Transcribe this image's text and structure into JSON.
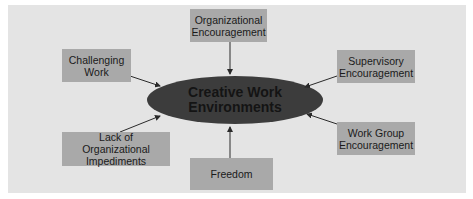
{
  "diagram": {
    "center": {
      "label": "Creative Work\nEnvironments",
      "color": "#3c3c3c"
    },
    "nodes": [
      {
        "id": "organizational-encouragement",
        "label": "Organizational\nEncouragement",
        "position": "top"
      },
      {
        "id": "challenging-work",
        "label": "Challenging\nWork",
        "position": "top-left"
      },
      {
        "id": "supervisory-encouragement",
        "label": "Supervisory\nEncouragement",
        "position": "top-right"
      },
      {
        "id": "lack-of-organizational-impediments",
        "label": "Lack of Organizational\nImpediments",
        "position": "bottom-left"
      },
      {
        "id": "freedom",
        "label": "Freedom",
        "position": "bottom"
      },
      {
        "id": "work-group-encouragement",
        "label": "Work Group\nEncouragement",
        "position": "bottom-right"
      }
    ],
    "edges": [
      {
        "from": "organizational-encouragement",
        "to": "center"
      },
      {
        "from": "challenging-work",
        "to": "center"
      },
      {
        "from": "supervisory-encouragement",
        "to": "center"
      },
      {
        "from": "lack-of-organizational-impediments",
        "to": "center"
      },
      {
        "from": "freedom",
        "to": "center"
      },
      {
        "from": "work-group-encouragement",
        "to": "center"
      }
    ],
    "colors": {
      "panel": "#e4e4e4",
      "box": "#a9a9a9",
      "ellipse": "#3c3c3c",
      "arrow": "#2a2a2a"
    }
  }
}
